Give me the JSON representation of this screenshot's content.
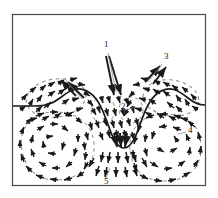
{
  "figure": {
    "kind": "velocity-vector-field-diagram",
    "title": "",
    "frame": {
      "x": 12,
      "y": 14,
      "width": 194,
      "height": 172,
      "stroke": "#4a4a4a",
      "stroke_width": 1,
      "fill": "#ffffff"
    },
    "colors": {
      "background": "#ffffff",
      "frame": "#4a4a4a",
      "interface": "#1a1a1a",
      "vector": "#1a1a1a",
      "label": "#111111",
      "leader": "#6b6b6b"
    },
    "labels": [
      {
        "id": "1",
        "text": "1",
        "x": 106,
        "y": 44,
        "description": "downward converging jet at crest centre"
      },
      {
        "id": "2",
        "text": "2",
        "x": 123,
        "y": 107,
        "description": "central dashed recirculation cell"
      },
      {
        "id": "3",
        "text": "3",
        "x": 165,
        "y": 57,
        "description": "upward outflow above right hump"
      },
      {
        "id": "4",
        "text": "4",
        "x": 189,
        "y": 131,
        "description": "large right-hand vortex"
      },
      {
        "id": "5",
        "text": "5",
        "x": 105,
        "y": 182,
        "description": "downward outflow at base centre"
      }
    ],
    "interface": {
      "name": "phase-interface",
      "description": "solid wavy boundary with two humps and a deep central trough",
      "path": "M 13 106 L 34 106 C 46 106 52 104 60 98 C 70 90 78 85 90 93 C 100 100 104 114 110 130 C 114 141 118 148 124 148 C 130 148 134 141 138 130 C 144 114 148 100 158 93 C 170 85 178 90 188 98 C 194 103 199 105 205 105 L 206 105"
    },
    "dashed_cells": [
      {
        "name": "left-upper-cell",
        "cx": 56,
        "cy": 98,
        "rx": 30,
        "ry": 19,
        "rotation": -8
      },
      {
        "name": "centre-left-cell",
        "cx": 103,
        "cy": 110,
        "rx": 12,
        "ry": 13,
        "rotation": 0
      },
      {
        "name": "centre-right-cell",
        "cx": 131,
        "cy": 110,
        "rx": 12,
        "ry": 13,
        "rotation": 0
      },
      {
        "name": "right-upper-cell",
        "cx": 171,
        "cy": 98,
        "rx": 28,
        "ry": 18,
        "rotation": 8
      },
      {
        "name": "left-lower-vortex",
        "cx": 57,
        "cy": 145,
        "rx": 39,
        "ry": 33,
        "rotation": 0
      },
      {
        "name": "right-lower-vortex",
        "cx": 165,
        "cy": 147,
        "rx": 36,
        "ry": 32,
        "rotation": 0
      }
    ],
    "annotated_arrows": [
      {
        "name": "jet-arrow-left",
        "from": [
          106,
          56
        ],
        "to": [
          114,
          96
        ],
        "head": "down"
      },
      {
        "name": "jet-arrow-right",
        "from": [
          108,
          56
        ],
        "to": [
          121,
          96
        ],
        "head": "down"
      },
      {
        "name": "outflow-arrow-inner",
        "from": [
          160,
          66
        ],
        "to": [
          143,
          79
        ],
        "head": "up-right"
      },
      {
        "name": "outflow-arrow-outer",
        "from": [
          163,
          66
        ],
        "to": [
          150,
          80
        ],
        "head": "up-right"
      },
      {
        "name": "left-crest-arrow-inner",
        "from": [
          60,
          82
        ],
        "to": [
          73,
          95
        ],
        "head": "up-left"
      },
      {
        "name": "left-crest-arrow-outer",
        "from": [
          63,
          82
        ],
        "to": [
          80,
          97
        ],
        "head": "up-left"
      },
      {
        "name": "trough-converge-left",
        "from": [
          116,
          132
        ],
        "to": [
          119,
          148
        ],
        "head": "down"
      },
      {
        "name": "trough-converge-right",
        "from": [
          127,
          132
        ],
        "to": [
          124,
          148
        ],
        "head": "down"
      }
    ],
    "caption": ""
  }
}
